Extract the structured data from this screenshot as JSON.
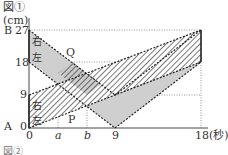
{
  "figure": {
    "title": "図①",
    "unit": "(cm)",
    "x_unit_label": "18(秒)",
    "point_A": "A",
    "point_B": "B",
    "point_P": "P",
    "point_Q": "Q",
    "y_ticks": [
      "0",
      "9",
      "18",
      "27"
    ],
    "x_ticks": [
      "0",
      "a",
      "b",
      "9"
    ],
    "band_labels_upper": [
      "右",
      "左"
    ],
    "band_labels_lower": [
      "右",
      "左"
    ],
    "next_figure": "図②"
  }
}
